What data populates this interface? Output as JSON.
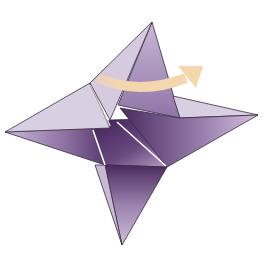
{
  "diagram": {
    "colors": {
      "background": "#ffffff",
      "paper_light": "#d9cfe2",
      "paper_mid": "#b7a2c6",
      "paper_dark": "#4a2a5e",
      "outline": "#3a2a40",
      "crease": "#ffffff",
      "arrow": "#f5d7ae"
    },
    "points": {
      "top": [
        152,
        22
      ],
      "left": [
        5,
        132
      ],
      "right": [
        258,
        115
      ],
      "bottom": [
        122,
        245
      ]
    },
    "arrow": {
      "meaning": "fold-over-direction",
      "direction": "right"
    }
  }
}
